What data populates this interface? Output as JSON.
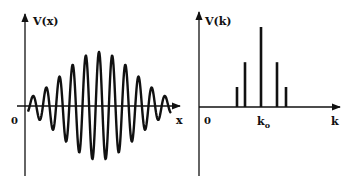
{
  "left_panel": {
    "y_label": "V(x)",
    "origin_label": "0",
    "x_label": "x",
    "description": "Gaussian-modulated oscillation (wave packet) in real space"
  },
  "right_panel": {
    "y_label": "V(k)",
    "origin_label": "0",
    "center_label_main": "k",
    "center_label_sub": "o",
    "x_label": "k",
    "description": "Discrete Fourier components centered at k_o"
  },
  "chart_data": [
    {
      "type": "line",
      "title": "",
      "xlabel": "x",
      "ylabel": "V(x)",
      "description": "Wave packet: sinusoid with bell-shaped envelope, ~11 oscillations, max amplitude at center",
      "envelope": "gaussian",
      "oscillations": 11,
      "grid": false
    },
    {
      "type": "bar",
      "title": "",
      "xlabel": "k",
      "ylabel": "V(k)",
      "categories": [
        "k_o-2",
        "k_o-1",
        "k_o",
        "k_o+1",
        "k_o+2"
      ],
      "values": [
        0.25,
        0.56,
        1.0,
        0.56,
        0.25
      ],
      "tick_labels": [
        "0",
        "k_o"
      ],
      "grid": false
    }
  ],
  "colors": {
    "stroke": "#111111",
    "background": "#ffffff"
  }
}
